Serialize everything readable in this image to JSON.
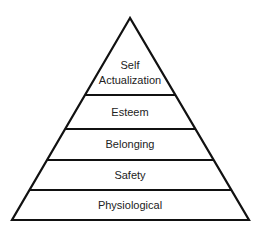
{
  "diagram": {
    "type": "pyramid",
    "title": "",
    "stroke_color": "#111111",
    "background": "#ffffff",
    "levels": [
      {
        "label_line1": "Self",
        "label_line2": "Actualization"
      },
      {
        "label": "Esteem"
      },
      {
        "label": "Belonging"
      },
      {
        "label": "Safety"
      },
      {
        "label": "Physiological"
      }
    ]
  }
}
